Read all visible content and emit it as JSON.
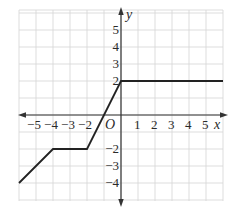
{
  "figure": {
    "type": "coordinate-plane-graph",
    "colors": {
      "grid": "#d4d4d4",
      "axis": "#333333",
      "curve": "#222222",
      "background": "#ffffff"
    },
    "axes": {
      "x_label": "x",
      "y_label": "y",
      "origin_label": "O",
      "x_range": [
        -6,
        6
      ],
      "y_range": [
        -5,
        6
      ],
      "x_ticks": [
        {
          "value": -5,
          "label": "−5"
        },
        {
          "value": -4,
          "label": "−4"
        },
        {
          "value": -3,
          "label": "−3"
        },
        {
          "value": -2,
          "label": "−2"
        },
        {
          "value": 1,
          "label": "1"
        },
        {
          "value": 2,
          "label": "2"
        },
        {
          "value": 3,
          "label": "3"
        },
        {
          "value": 4,
          "label": "4"
        },
        {
          "value": 5,
          "label": "5"
        }
      ],
      "y_ticks": [
        {
          "value": 5,
          "label": "5"
        },
        {
          "value": 4,
          "label": "4"
        },
        {
          "value": 3,
          "label": "3"
        },
        {
          "value": 2,
          "label": "2"
        },
        {
          "value": -2,
          "label": "−2"
        },
        {
          "value": -3,
          "label": "−3"
        },
        {
          "value": -4,
          "label": "−4"
        }
      ]
    },
    "curve_points": [
      [
        -6,
        -4
      ],
      [
        -4,
        -2
      ],
      [
        -2,
        -2
      ],
      [
        0,
        2
      ],
      [
        6,
        2
      ]
    ]
  }
}
